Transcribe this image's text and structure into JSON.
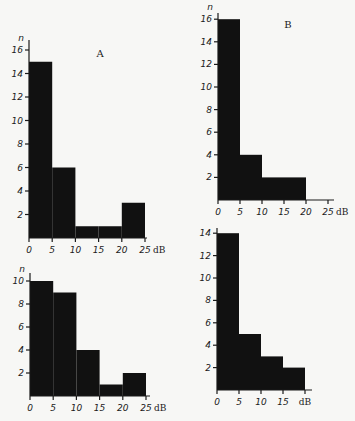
{
  "chart_data": [
    {
      "type": "bar",
      "panel": "A",
      "title": "A",
      "xlabel": "dB",
      "ylabel": "n",
      "bins": [
        [
          0,
          5
        ],
        [
          5,
          10
        ],
        [
          10,
          15
        ],
        [
          15,
          20
        ],
        [
          20,
          25
        ]
      ],
      "categories": [
        "0-5",
        "5-10",
        "10-15",
        "15-20",
        "20-25"
      ],
      "values": [
        15,
        6,
        1,
        1,
        3
      ],
      "xticks": [
        "0",
        "5",
        "10",
        "15",
        "20",
        "25"
      ],
      "yticks": [
        "2",
        "4",
        "6",
        "8",
        "10",
        "12",
        "14",
        "16"
      ],
      "xlim": [
        0,
        25
      ],
      "ylim": [
        0,
        16
      ],
      "grid": false,
      "layout": {
        "x0": 29,
        "y0": 238,
        "px_per_db": 4.64,
        "px_per_n": 11.75,
        "xaxis_end": 147,
        "yaxis_top": 40,
        "label_x": 100,
        "label_y": 57
      }
    },
    {
      "type": "bar",
      "panel": "B",
      "title": "B",
      "xlabel": "dB",
      "ylabel": "n",
      "bins": [
        [
          0,
          5
        ],
        [
          5,
          10
        ],
        [
          10,
          15
        ],
        [
          15,
          20
        ]
      ],
      "categories": [
        "0-5",
        "5-10",
        "10-15",
        "15-20"
      ],
      "values": [
        16,
        4,
        2,
        2
      ],
      "xticks": [
        "0",
        "5",
        "10",
        "15",
        "20",
        "25"
      ],
      "yticks": [
        "2",
        "4",
        "6",
        "8",
        "10",
        "12",
        "14",
        "16"
      ],
      "xlim": [
        0,
        25
      ],
      "ylim": [
        0,
        16
      ],
      "grid": false,
      "layout": {
        "x0": 218,
        "y0": 200,
        "px_per_db": 4.4,
        "px_per_n": 11.3,
        "xaxis_end": 334,
        "yaxis_top": 13,
        "label_x": 288,
        "label_y": 28
      }
    },
    {
      "type": "bar",
      "panel": "C",
      "title": "",
      "xlabel": "dB",
      "ylabel": "n",
      "bins": [
        [
          0,
          5
        ],
        [
          5,
          10
        ],
        [
          10,
          15
        ],
        [
          15,
          20
        ],
        [
          20,
          25
        ]
      ],
      "categories": [
        "0-5",
        "5-10",
        "10-15",
        "15-20",
        "20-25"
      ],
      "values": [
        10,
        9,
        4,
        1,
        2
      ],
      "xticks": [
        "0",
        "5",
        "10",
        "15",
        "20",
        "25"
      ],
      "yticks": [
        "2",
        "4",
        "6",
        "8",
        "10"
      ],
      "xlim": [
        0,
        25
      ],
      "ylim": [
        0,
        10
      ],
      "grid": false,
      "layout": {
        "x0": 30,
        "y0": 396,
        "px_per_db": 4.64,
        "px_per_n": 11.5,
        "xaxis_end": 150,
        "yaxis_top": 273,
        "label_x": null,
        "label_y": null
      }
    },
    {
      "type": "bar",
      "panel": "D",
      "title": "",
      "xlabel": "dB",
      "ylabel": "",
      "bins": [
        [
          0,
          5
        ],
        [
          5,
          10
        ],
        [
          10,
          15
        ],
        [
          15,
          20
        ]
      ],
      "categories": [
        "0-5",
        "5-10",
        "10-15",
        "15-20"
      ],
      "values": [
        14,
        5,
        3,
        2
      ],
      "xticks": [
        "0",
        "5",
        "10",
        "15"
      ],
      "yticks": [
        "2",
        "4",
        "6",
        "8",
        "10",
        "12",
        "14"
      ],
      "xlim": [
        0,
        20
      ],
      "ylim": [
        0,
        14
      ],
      "grid": false,
      "layout": {
        "x0": 217,
        "y0": 390,
        "px_per_db": 4.4,
        "px_per_n": 11.2,
        "xaxis_end": 312,
        "yaxis_top": 228,
        "label_x": null,
        "label_y": null
      }
    }
  ]
}
